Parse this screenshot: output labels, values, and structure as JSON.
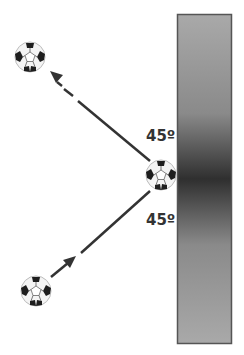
{
  "diagram": {
    "title": "",
    "wall": {
      "x": 177,
      "y": 14,
      "width": 54,
      "height": 329,
      "edge_color": "#555555",
      "gradient_light": "#a8a8a8",
      "gradient_dark": "#2e2e2e"
    },
    "balls": [
      {
        "id": "ball-top-left",
        "cx": 30,
        "cy": 57,
        "r": 15
      },
      {
        "id": "ball-wall",
        "cx": 161,
        "cy": 175,
        "r": 15
      },
      {
        "id": "ball-bottom-left",
        "cx": 36,
        "cy": 291,
        "r": 15
      }
    ],
    "angles": [
      {
        "label": "45º",
        "x": 146,
        "y": 129
      },
      {
        "label": "45º",
        "x": 146,
        "y": 213
      }
    ],
    "arrows": [
      {
        "name": "incoming-arrow",
        "from": [
          50,
          275
        ],
        "to": [
          73,
          257
        ],
        "line_from": [
          80,
          252
        ],
        "line_to": [
          150,
          190
        ]
      },
      {
        "name": "outgoing-arrow",
        "from": [
          150,
          162
        ],
        "to": [
          75,
          100
        ],
        "dash_from": [
          70,
          96
        ],
        "dash_to": [
          62,
          89
        ],
        "head_at": [
          50,
          72
        ]
      }
    ]
  }
}
